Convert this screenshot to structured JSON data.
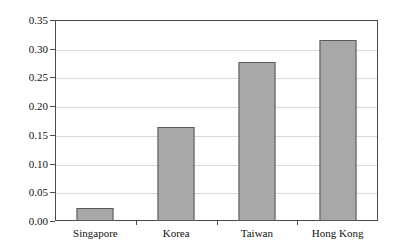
{
  "chart_data": {
    "type": "bar",
    "title": "",
    "xlabel": "",
    "ylabel": "",
    "categories": [
      "Singapore",
      "Korea",
      "Taiwan",
      "Hong Kong"
    ],
    "values": [
      0.023,
      0.164,
      0.277,
      0.315
    ],
    "ylim": [
      0.0,
      0.35
    ],
    "ytick_step": 0.05,
    "ytick_labels": [
      "0.00",
      "0.05",
      "0.10",
      "0.15",
      "0.20",
      "0.25",
      "0.30",
      "0.35"
    ],
    "ytick_values": [
      0.0,
      0.05,
      0.1,
      0.15,
      0.2,
      0.25,
      0.3,
      0.35
    ],
    "grid": true,
    "legend": null,
    "colors": {
      "bar_fill": "#a8a8a8",
      "bar_border": "#595959",
      "gridline": "#d8d8d8",
      "frame": "#4a4a4a",
      "text": "#111111",
      "background": "#ffffff"
    }
  }
}
